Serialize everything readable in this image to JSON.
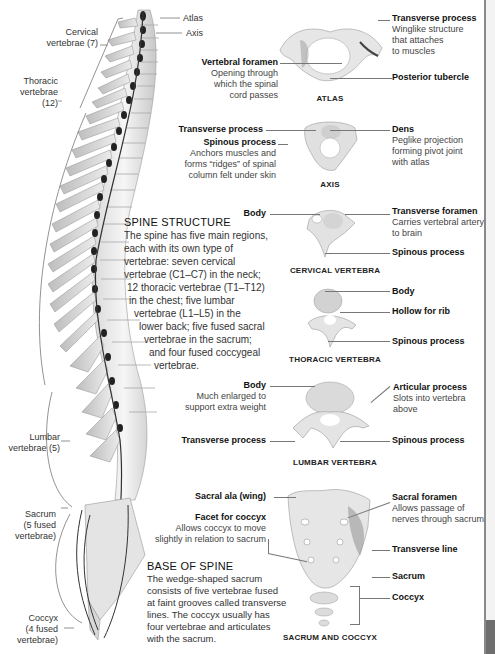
{
  "spine_labels": {
    "atlas": "Atlas",
    "axis": "Axis",
    "cervical": [
      "Cervical",
      "vertebrae (7)"
    ],
    "thoracic": [
      "Thoracic",
      "vertebrae (12)"
    ],
    "lumbar": [
      "Lumbar",
      "vertebrae (5)"
    ],
    "sacrum": [
      "Sacrum",
      "(5 fused",
      "vertebrae)"
    ],
    "coccyx": [
      "Coccyx",
      "(4 fused",
      "vertebrae)"
    ]
  },
  "spine_structure": {
    "heading": "SPINE STRUCTURE",
    "lines": [
      "The spine has five main regions,",
      "each with its own type of",
      "vertebrae: seven cervical",
      "vertebrae (C1–C7) in the neck;",
      "12 thoracic vertebrae (T1–T12)",
      "in the chest; five lumbar",
      "vertebrae (L1–L5) in the",
      "lower back; five fused sacral",
      "vertebrae in the sacrum;",
      "and four fused coccygeal",
      "vertebrae."
    ]
  },
  "base_of_spine": {
    "heading": "BASE OF SPINE",
    "lines": [
      "The wedge-shaped sacrum",
      "consists of five vertebrae fused",
      "at faint grooves called transverse",
      "lines. The coccyx usually has",
      "four vertebrae and articulates",
      "with the sacrum."
    ]
  },
  "atlas": {
    "caption": "ATLAS",
    "vertebral_foramen": {
      "title": "Vertebral foramen",
      "desc": [
        "Opening through",
        "which the spinal",
        "cord passes"
      ]
    },
    "transverse_process": {
      "title": "Transverse process",
      "desc": [
        "Winglike structure",
        "that attaches",
        "to muscles"
      ]
    },
    "posterior_tubercle": {
      "title": "Posterior tubercle"
    }
  },
  "axis": {
    "caption": "AXIS",
    "transverse_process": {
      "title": "Transverse process"
    },
    "spinous_process": {
      "title": "Spinous process",
      "desc": [
        "Anchors muscles and",
        "forms “ridges” of spinal",
        "column felt under skin"
      ]
    },
    "dens": {
      "title": "Dens",
      "desc": [
        "Peglike projection",
        "forming pivot joint",
        "with atlas"
      ]
    }
  },
  "cervical": {
    "caption": "CERVICAL VERTEBRA",
    "body": {
      "title": "Body"
    },
    "transverse_foramen": {
      "title": "Transverse foramen",
      "desc": [
        "Carries vertebral artery",
        "to brain"
      ]
    },
    "spinous_process": {
      "title": "Spinous process"
    }
  },
  "thoracic": {
    "caption": "THORACIC VERTEBRA",
    "body": {
      "title": "Body"
    },
    "hollow_for_rib": {
      "title": "Hollow for rib"
    },
    "spinous_process": {
      "title": "Spinous process"
    }
  },
  "lumbar": {
    "caption": "LUMBAR VERTEBRA",
    "body": {
      "title": "Body",
      "desc": [
        "Much enlarged to",
        "support extra weight"
      ]
    },
    "transverse_process": {
      "title": "Transverse process"
    },
    "articular_process": {
      "title": "Articular process",
      "desc": [
        "Slots into vertebra",
        "above"
      ]
    },
    "spinous_process": {
      "title": "Spinous process"
    }
  },
  "sacrum_coccyx": {
    "caption": "SACRUM AND COCCYX",
    "sacral_ala": {
      "title": "Sacral ala (wing)"
    },
    "facet_for_coccyx": {
      "title": "Facet for coccyx",
      "desc": [
        "Allows coccyx to move",
        "slightly in relation to sacrum"
      ]
    },
    "sacral_foramen": {
      "title": "Sacral foramen",
      "desc": [
        "Allows passage of",
        "nerves through sacrum"
      ]
    },
    "transverse_line": {
      "title": "Transverse line"
    },
    "sacrum": {
      "title": "Sacrum"
    },
    "coccyx": {
      "title": "Coccyx"
    }
  }
}
